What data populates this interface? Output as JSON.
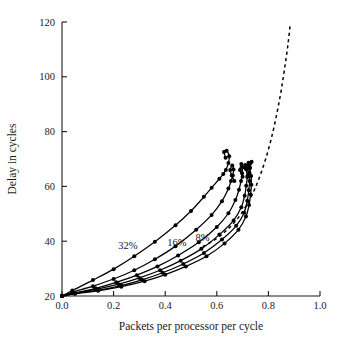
{
  "chart_data": {
    "type": "line",
    "title": "",
    "xlabel": "Packets per processor per cycle",
    "ylabel": "Delay in cycles",
    "xlim": [
      0.0,
      1.0
    ],
    "ylim": [
      20,
      120
    ],
    "xticks": [
      "0.0",
      "0.2",
      "0.4",
      "0.6",
      "0.8",
      "1.0"
    ],
    "xtick_values": [
      0.0,
      0.2,
      0.4,
      0.6,
      0.8,
      1.0
    ],
    "yticks": [
      "20",
      "40",
      "60",
      "80",
      "100",
      "120"
    ],
    "ytick_values": [
      20,
      40,
      60,
      80,
      100,
      120
    ],
    "grid": false,
    "legend": "none",
    "annotations": [
      {
        "text": "32%",
        "x": 0.255,
        "y": 37.0
      },
      {
        "text": "16%",
        "x": 0.445,
        "y": 38.4
      },
      {
        "text": "8%",
        "x": 0.545,
        "y": 40.0
      }
    ],
    "series": [
      {
        "name": "32%",
        "style": "solid-with-markers",
        "x": [
          0.0,
          0.04,
          0.12,
          0.2,
          0.28,
          0.36,
          0.44,
          0.5,
          0.55,
          0.58,
          0.61,
          0.625,
          0.635,
          0.645,
          0.648,
          0.638,
          0.628,
          0.634
        ],
        "y": [
          20.0,
          22.0,
          25.8,
          29.8,
          34.5,
          39.8,
          45.8,
          51.0,
          56.2,
          59.5,
          62.8,
          64.5,
          66.0,
          68.5,
          71.0,
          73.0,
          72.6,
          70.5
        ]
      },
      {
        "name": "16%",
        "style": "solid-with-markers",
        "x": [
          0.0,
          0.04,
          0.12,
          0.2,
          0.28,
          0.36,
          0.44,
          0.52,
          0.58,
          0.62,
          0.645,
          0.655,
          0.662,
          0.665,
          0.66,
          0.652,
          0.658,
          0.668
        ],
        "y": [
          20.0,
          21.4,
          23.6,
          26.2,
          29.4,
          33.4,
          38.2,
          44.2,
          49.6,
          54.6,
          59.2,
          62.0,
          64.0,
          66.2,
          67.6,
          66.0,
          64.0,
          62.0
        ]
      },
      {
        "name": "8%",
        "style": "solid-with-markers",
        "x": [
          0.0,
          0.05,
          0.13,
          0.21,
          0.29,
          0.37,
          0.45,
          0.53,
          0.6,
          0.645,
          0.672,
          0.686,
          0.694,
          0.698,
          0.7,
          0.695,
          0.69,
          0.7
        ],
        "y": [
          20.0,
          21.1,
          22.8,
          25.0,
          27.6,
          30.8,
          34.8,
          39.6,
          45.2,
          50.2,
          55.0,
          58.8,
          62.0,
          64.8,
          67.0,
          68.2,
          66.0,
          63.5
        ]
      },
      {
        "name": "4%",
        "style": "solid-with-markers",
        "x": [
          0.0,
          0.05,
          0.13,
          0.22,
          0.3,
          0.38,
          0.46,
          0.54,
          0.61,
          0.665,
          0.695,
          0.708,
          0.714,
          0.718,
          0.716,
          0.71,
          0.712,
          0.72
        ],
        "y": [
          20.0,
          21.0,
          22.4,
          24.3,
          26.6,
          29.4,
          32.9,
          37.2,
          42.4,
          47.6,
          52.4,
          56.6,
          60.2,
          63.4,
          66.2,
          67.8,
          66.4,
          64.0
        ]
      },
      {
        "name": "2%",
        "style": "solid-with-markers",
        "x": [
          0.0,
          0.05,
          0.14,
          0.23,
          0.31,
          0.39,
          0.47,
          0.55,
          0.62,
          0.675,
          0.706,
          0.718,
          0.724,
          0.727,
          0.726,
          0.721,
          0.723,
          0.728
        ],
        "y": [
          20.0,
          20.9,
          22.1,
          23.8,
          25.9,
          28.5,
          31.7,
          35.7,
          40.6,
          45.6,
          50.4,
          54.8,
          58.6,
          62.0,
          65.0,
          67.4,
          68.6,
          67.0
        ]
      },
      {
        "name": "0%",
        "style": "solid-with-markers",
        "x": [
          0.0,
          0.05,
          0.14,
          0.23,
          0.32,
          0.4,
          0.48,
          0.56,
          0.63,
          0.684,
          0.713,
          0.725,
          0.731,
          0.734,
          0.733,
          0.728,
          0.73,
          0.735
        ],
        "y": [
          20.0,
          20.8,
          21.9,
          23.4,
          25.4,
          27.8,
          30.8,
          34.5,
          39.2,
          44.2,
          49.0,
          53.2,
          57.0,
          60.6,
          63.8,
          66.6,
          68.4,
          69.0
        ]
      },
      {
        "name": "reference-asymptote",
        "style": "dashed",
        "x": [
          0.545,
          0.6,
          0.645,
          0.685,
          0.718,
          0.745,
          0.768,
          0.79,
          0.81,
          0.828,
          0.845,
          0.858,
          0.869,
          0.878,
          0.885
        ],
        "y": [
          38.0,
          41.0,
          44.6,
          48.8,
          53.6,
          58.6,
          64.0,
          70.2,
          77.0,
          84.4,
          92.6,
          100.0,
          107.0,
          113.5,
          119.5
        ]
      }
    ]
  }
}
